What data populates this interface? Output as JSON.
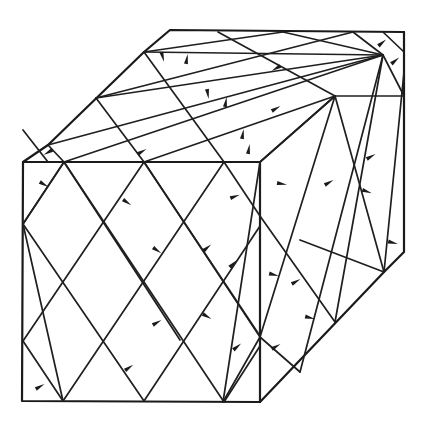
{
  "figure": {
    "title": "",
    "colors": {
      "background": "#ffffff",
      "ink": "#1a1a1a"
    }
  },
  "cube": {
    "front_face": {
      "label": ""
    },
    "top_face": {
      "label": ""
    },
    "right_face": {
      "label": ""
    }
  },
  "arrows": {
    "count_front": 11,
    "count_top": 10,
    "count_right": 11
  }
}
